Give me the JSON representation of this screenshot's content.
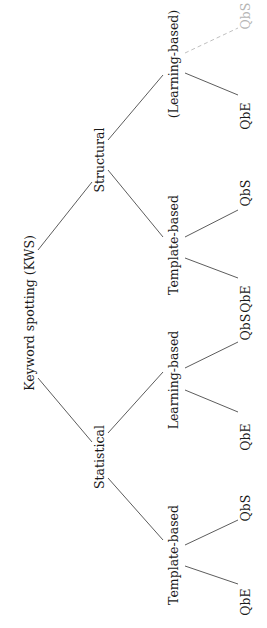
{
  "diagram": {
    "type": "tree",
    "orientation": "rotated-90-ccw",
    "root": {
      "label": "Keyword spotting (KWS)",
      "children": [
        {
          "label": "Statistical",
          "children": [
            {
              "label": "Template-based",
              "children": [
                {
                  "label": "QbE"
                },
                {
                  "label": "QbS"
                }
              ]
            },
            {
              "label": "Learning-based",
              "children": [
                {
                  "label": "QbE"
                },
                {
                  "label": "QbS"
                }
              ]
            }
          ]
        },
        {
          "label": "Structural",
          "children": [
            {
              "label": "Template-based",
              "children": [
                {
                  "label": "QbE"
                },
                {
                  "label": "QbS"
                }
              ]
            },
            {
              "label": "(Learning-based)",
              "children": [
                {
                  "label": "QbE"
                },
                {
                  "label": "QbS",
                  "style": "muted-dashed"
                }
              ]
            }
          ]
        }
      ]
    },
    "labels": {
      "root": "Keyword spotting (KWS)",
      "statistical": "Statistical",
      "structural": "Structural",
      "stat_template": "Template-based",
      "stat_learning": "Learning-based",
      "struct_template": "Template-based",
      "struct_learning": "(Learning-based)",
      "stat_template_qbe": "QbE",
      "stat_template_qbs": "QbS",
      "stat_learning_qbe": "QbE",
      "stat_learning_qbs": "QbS",
      "struct_template_qbe": "QbE",
      "struct_template_qbs": "QbS",
      "struct_learning_qbe": "QbE",
      "struct_learning_qbs": "QbS"
    },
    "colors": {
      "edge": "#4a4a4a",
      "text": "#1a1a1a",
      "muted": "#b5b5b5"
    }
  }
}
